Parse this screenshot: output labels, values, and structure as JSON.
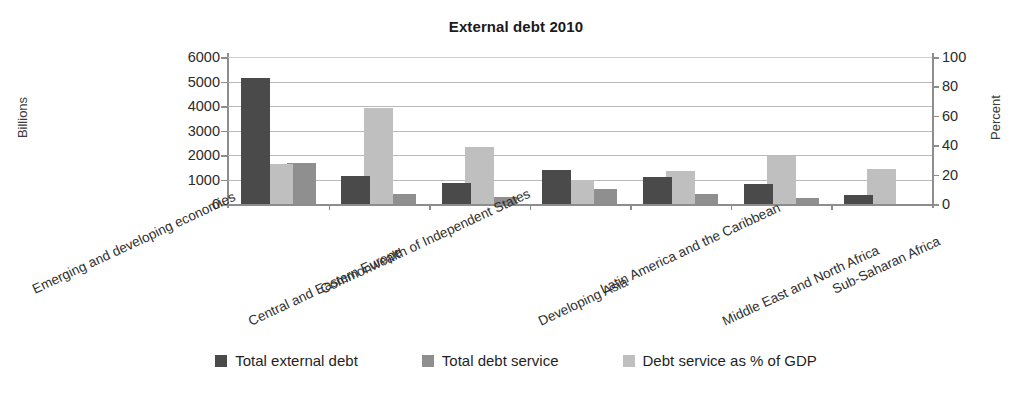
{
  "chart_data": {
    "type": "bar",
    "title": "External debt 2010",
    "xlabel": "",
    "ylabel": "Billions",
    "ylabel_secondary": "Percent",
    "ylim": [
      0,
      6000
    ],
    "ylim_secondary": [
      0,
      100
    ],
    "yticks": [
      0,
      1000,
      2000,
      3000,
      4000,
      5000,
      6000
    ],
    "yticks_secondary": [
      0,
      20,
      40,
      60,
      80,
      100
    ],
    "grid": true,
    "legend_position": "bottom",
    "bar_overlap": true,
    "categories": [
      "Emerging and developing economies",
      "Central and Eastern Europe",
      "Commonwealth of Independent States",
      "Developing Asia",
      "Latin America and the Caribbean",
      "Middle East and North Africa",
      "Sub-Saharan Africa"
    ],
    "series": [
      {
        "name": "Total external debt",
        "color": "#4a4a4a",
        "axis": "left",
        "unit": "Billions",
        "values": [
          5130,
          1150,
          850,
          1400,
          1120,
          800,
          350
        ]
      },
      {
        "name": "Total debt service",
        "color": "#8f8f8f",
        "axis": "left",
        "unit": "Billions",
        "values": [
          1680,
          400,
          280,
          600,
          400,
          250,
          0
        ]
      },
      {
        "name": "Debt service as % of GDP",
        "color": "#bfbfbf",
        "axis": "right",
        "unit": "Percent",
        "values": [
          27.5,
          65.5,
          39.0,
          16.5,
          22.5,
          32.5,
          24.0
        ]
      }
    ]
  },
  "legend": {
    "items": [
      {
        "label": "Total external debt"
      },
      {
        "label": "Total debt service"
      },
      {
        "label": "Debt service as % of GDP"
      }
    ]
  }
}
